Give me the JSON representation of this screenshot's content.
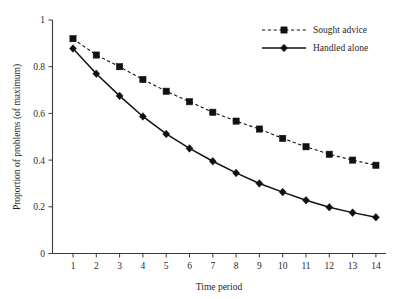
{
  "chart_data": {
    "type": "line",
    "title": "",
    "xlabel": "Time period",
    "ylabel": "Proportion of problems (of maximum)",
    "x": [
      1,
      2,
      3,
      4,
      5,
      6,
      7,
      8,
      9,
      10,
      11,
      12,
      13,
      14
    ],
    "xticklabels": [
      "1",
      "2",
      "3",
      "4",
      "5",
      "6",
      "7",
      "8",
      "9",
      "10",
      "11",
      "12",
      "13",
      "14"
    ],
    "yticks": [
      0,
      0.2,
      0.4,
      0.6,
      0.8,
      1
    ],
    "yticklabels": [
      "0",
      "0.2",
      "0.4",
      "0.6",
      "0.8",
      "1"
    ],
    "xlim": [
      0.55,
      14.45
    ],
    "ylim": [
      0,
      1
    ],
    "grid": false,
    "legend_position": "top-right",
    "series": [
      {
        "name": "Sought advice",
        "marker": "square",
        "linestyle": "dashed",
        "color": "#111111",
        "values": [
          0.92,
          0.85,
          0.8,
          0.745,
          0.695,
          0.65,
          0.605,
          0.567,
          0.533,
          0.493,
          0.457,
          0.425,
          0.4,
          0.378
        ]
      },
      {
        "name": "Handled alone",
        "marker": "diamond",
        "linestyle": "solid",
        "color": "#111111",
        "values": [
          0.878,
          0.77,
          0.675,
          0.587,
          0.512,
          0.45,
          0.395,
          0.345,
          0.3,
          0.263,
          0.228,
          0.198,
          0.175,
          0.155
        ]
      }
    ]
  },
  "legend": {
    "items": [
      {
        "label": "Sought advice"
      },
      {
        "label": "Handled alone"
      }
    ]
  }
}
